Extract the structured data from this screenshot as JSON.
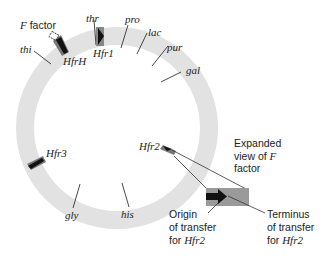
{
  "diagram": {
    "colors": {
      "chromosome_ring": "#e2e2e2",
      "insert_dark": "#111111",
      "insert_mid": "#777777",
      "expanded_box": "#9a9a9a",
      "line": "#333333",
      "text": "#222222"
    },
    "gene_markers": [
      {
        "label": "thr"
      },
      {
        "label": "pro"
      },
      {
        "label": "lac"
      },
      {
        "label": "pur"
      },
      {
        "label": "gal"
      },
      {
        "label": "his"
      },
      {
        "label": "gly"
      },
      {
        "label": "thi"
      }
    ],
    "hfr_sites": [
      {
        "label": "HfrH"
      },
      {
        "label": "Hfr1"
      },
      {
        "label": "Hfr2"
      },
      {
        "label": "Hfr3"
      }
    ],
    "f_factor_label": {
      "prefix": "F",
      "suffix": " factor"
    },
    "expanded_view": {
      "line1": "Expanded",
      "line2_prefix": "view of ",
      "line2_ital": "F",
      "line3": "factor"
    },
    "origin_label": {
      "line1": "Origin",
      "line2": "of transfer",
      "line3_prefix": "for ",
      "line3_ital": "Hfr2"
    },
    "terminus_label": {
      "line1": "Terminus",
      "line2": "of transfer",
      "line3_prefix": "for ",
      "line3_ital": "Hfr2"
    }
  }
}
